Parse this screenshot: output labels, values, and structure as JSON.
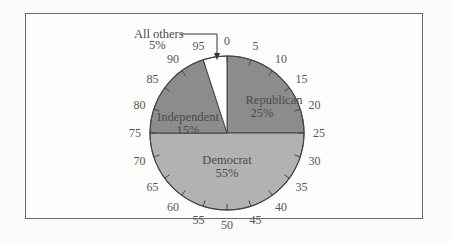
{
  "chart_data": {
    "type": "pie",
    "title": "",
    "slices": [
      {
        "label": "Republican",
        "percent": 25,
        "display": "25%",
        "color": "#8c8c8c"
      },
      {
        "label": "Democrat",
        "percent": 55,
        "display": "55%",
        "color": "#b2b2b2"
      },
      {
        "label": "Independent",
        "percent": 15,
        "display": "15%",
        "color": "#8c8c8c"
      },
      {
        "label": "All others",
        "percent": 5,
        "display": "5%",
        "color": "#ffffff"
      }
    ],
    "scale_ticks": [
      0,
      5,
      10,
      15,
      20,
      25,
      30,
      35,
      40,
      45,
      50,
      55,
      60,
      65,
      70,
      75,
      80,
      85,
      90,
      95
    ],
    "annotation": {
      "text": "All others",
      "value": "5%"
    }
  },
  "labels": {
    "republican": "Republican",
    "republican_pct": "25%",
    "democrat": "Democrat",
    "democrat_pct": "55%",
    "independent": "Independent",
    "independent_pct": "15%",
    "others": "All others",
    "others_pct": "5%"
  },
  "ticks": [
    "0",
    "5",
    "10",
    "15",
    "20",
    "25",
    "30",
    "35",
    "40",
    "45",
    "50",
    "55",
    "60",
    "65",
    "70",
    "75",
    "80",
    "85",
    "90",
    "95"
  ]
}
